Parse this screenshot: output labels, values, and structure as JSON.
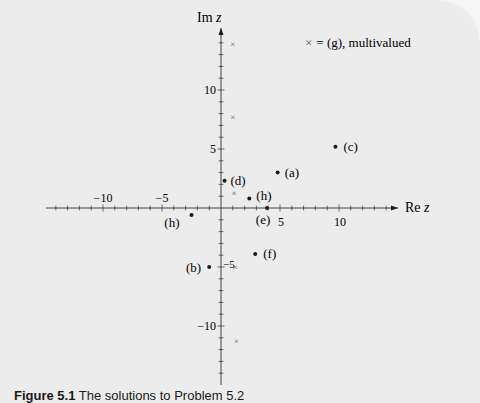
{
  "chart_data": {
    "type": "scatter",
    "title": "",
    "xlabel": "Re z",
    "ylabel": "Im z",
    "xlim": [
      -15,
      15
    ],
    "ylim": [
      -15,
      15
    ],
    "x_ticks": [
      -10,
      -5,
      5,
      10
    ],
    "x_tick_labels": [
      "−10",
      "−5",
      "5",
      "10"
    ],
    "y_ticks": [
      10,
      5,
      -5,
      -10
    ],
    "y_tick_labels": [
      "10",
      "5",
      "−5",
      "−10"
    ],
    "minor_tick_step": 1,
    "grid": false,
    "legend": {
      "text": "× = (g), multivalued",
      "position": "top-right"
    },
    "series": [
      {
        "name": "labeled solutions",
        "marker": "dot",
        "points": [
          {
            "label": "(a)",
            "x": 4.8,
            "y": 3.0
          },
          {
            "label": "(b)",
            "x": -1.0,
            "y": -5.0
          },
          {
            "label": "(c)",
            "x": 9.7,
            "y": 5.2
          },
          {
            "label": "(d)",
            "x": 0.3,
            "y": 2.3
          },
          {
            "label": "(e)",
            "x": 3.9,
            "y": 0.0
          },
          {
            "label": "(f)",
            "x": 2.9,
            "y": -3.9
          },
          {
            "label": "(h)",
            "x": 2.4,
            "y": 0.8
          },
          {
            "label": "(h)",
            "x": -2.5,
            "y": -0.6
          }
        ]
      },
      {
        "name": "(g), multivalued",
        "marker": "cross",
        "points": [
          {
            "x": 1.0,
            "y": 13.9
          },
          {
            "x": 1.0,
            "y": 7.7
          },
          {
            "x": 1.1,
            "y": 1.3
          },
          {
            "x": 1.2,
            "y": -5.0
          },
          {
            "x": 1.3,
            "y": -11.3
          }
        ]
      }
    ]
  },
  "axes": {
    "x_label_re": "Re ",
    "x_label_var": "z",
    "y_label_im": "Im ",
    "y_label_var": "z"
  },
  "legend": {
    "symbol": "×",
    "text": "= (g), multivalued"
  },
  "caption": {
    "label": "Figure 5.1",
    "text": " The solutions to Problem 5.2"
  },
  "style": {
    "background": "#ececec",
    "ink": "#1a1a1a",
    "cross_color": "#555555"
  }
}
